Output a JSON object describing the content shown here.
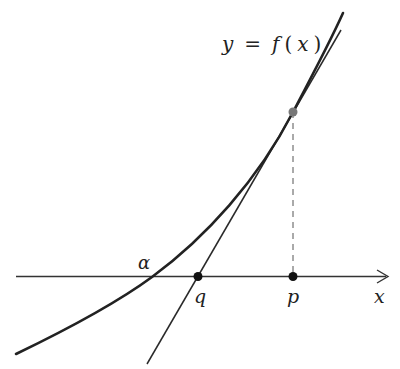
{
  "diagram": {
    "curve_label": {
      "y": "y",
      "eq": "=",
      "f": "f",
      "open": "(",
      "x": "x",
      "close": ")"
    },
    "axis_label": "x",
    "points": {
      "alpha": "α",
      "q": "q",
      "p": "p"
    },
    "colors": {
      "curve": "#222222",
      "tangent": "#2a2a2a",
      "axis": "#333333",
      "dashed": "#555555",
      "tangent_point": "#777777",
      "axis_points": "#111111"
    }
  }
}
